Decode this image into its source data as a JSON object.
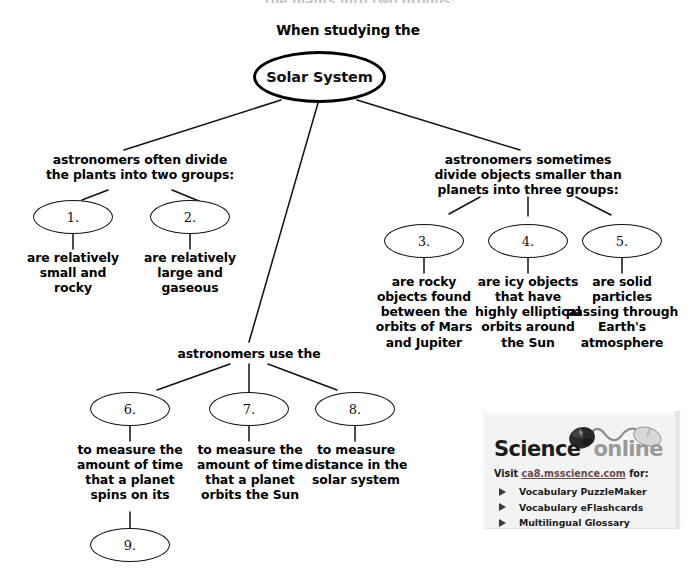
{
  "page": {
    "title": "When studying the",
    "cut_off_top_text": "the plants into two groups:"
  },
  "center": {
    "label": "Solar System"
  },
  "branches": [
    {
      "id": "branch-planets",
      "heading": "astronomers often divide\nthe plants into two groups:",
      "heading_lines": [
        "astronomers often divide",
        "the plants into two groups:"
      ],
      "nodes": [
        {
          "number": "1.",
          "description_lines": [
            "are relatively",
            "small and",
            "rocky"
          ]
        },
        {
          "number": "2.",
          "description_lines": [
            "are relatively",
            "large and",
            "gaseous"
          ]
        }
      ]
    },
    {
      "id": "branch-small-objects",
      "heading": "astronomers sometimes divide objects smaller than planets into three groups:",
      "heading_lines": [
        "astronomers sometimes",
        "divide objects smaller than",
        "planets into three groups:"
      ],
      "nodes": [
        {
          "number": "3.",
          "description_lines": [
            "are rocky",
            "objects found",
            "between the",
            "orbits of Mars",
            "and Jupiter"
          ]
        },
        {
          "number": "4.",
          "description_lines": [
            "are icy objects",
            "that have",
            "highly elliptical",
            "orbits around",
            "the Sun"
          ]
        },
        {
          "number": "5.",
          "description_lines": [
            "are solid",
            "particles",
            "passing through",
            "Earth's",
            "atmosphere"
          ]
        }
      ]
    },
    {
      "id": "branch-measures",
      "heading": "astronomers use the",
      "heading_lines": [
        "astronomers use the"
      ],
      "nodes": [
        {
          "number": "6.",
          "description_lines": [
            "to measure the",
            "amount of time",
            "that a planet",
            "spins on its"
          ],
          "child": {
            "number": "9."
          }
        },
        {
          "number": "7.",
          "description_lines": [
            "to measure the",
            "amount of time",
            "that a planet",
            "orbits the Sun"
          ]
        },
        {
          "number": "8.",
          "description_lines": [
            "to measure",
            "distance in the",
            "solar system"
          ]
        }
      ]
    }
  ],
  "promo": {
    "logo_primary": "Science",
    "logo_secondary": "online",
    "mouse_icon": "computer-mouse-icon",
    "visit_prefix": "Visit",
    "visit_url": "ca8.msscience.com",
    "visit_suffix": "for:",
    "items": [
      "Vocabulary PuzzleMaker",
      "Vocabulary eFlashcards",
      "Multilingual Glossary"
    ]
  },
  "colors": {
    "ink": "#000000",
    "oval_stroke": "#111111",
    "promo_bg": "#f3f3f3",
    "logo_gray": "#9a9a9a",
    "link": "#6b4a4a"
  }
}
